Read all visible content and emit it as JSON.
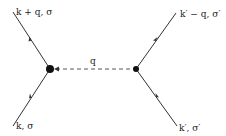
{
  "diagram": {
    "type": "feynman",
    "labels": {
      "top_left": "k + q, σ",
      "top_right": "k′ − q, σ′",
      "bottom_left": "k, σ",
      "bottom_right": "k′, σ′",
      "propagator": "q"
    },
    "colors": {
      "line": "#333333",
      "vertex": "#111111"
    }
  }
}
